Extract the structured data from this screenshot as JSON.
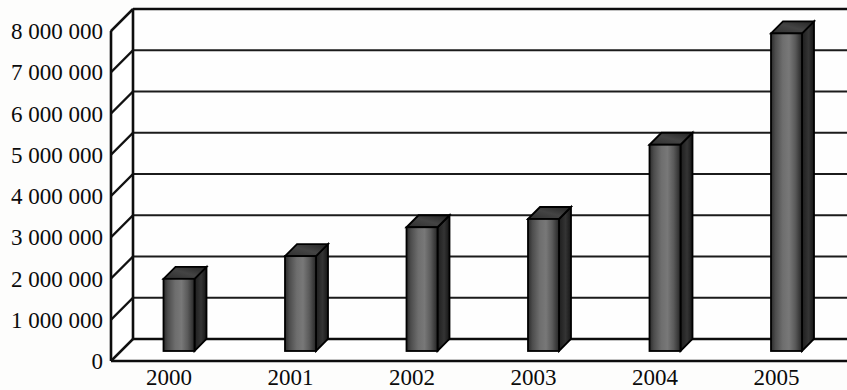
{
  "chart_data": {
    "type": "bar",
    "title": "",
    "subtitle": "",
    "xlabel": "",
    "ylabel": "",
    "categories": [
      "2000",
      "2001",
      "2002",
      "2003",
      "2004",
      "2005"
    ],
    "values": [
      1750000,
      2300000,
      3000000,
      3200000,
      5000000,
      7700000
    ],
    "series": [
      {
        "name": "",
        "values": [
          1750000,
          2300000,
          3000000,
          3200000,
          5000000,
          7700000
        ]
      }
    ],
    "ylim": [
      0,
      8000000
    ],
    "ytick_values": [
      0,
      1000000,
      2000000,
      3000000,
      4000000,
      5000000,
      6000000,
      7000000,
      8000000
    ],
    "ytick_labels": [
      "0",
      "1 000 000",
      "2 000 000",
      "3 000 000",
      "4 000 000",
      "5 000 000",
      "6 000 000",
      "7 000 000",
      "8 000 000"
    ],
    "grid": true,
    "grid_axis": "y",
    "legend": false,
    "legend_position": "none",
    "style": "3d-column",
    "bar_color": "#5f5f5f",
    "bar_edge_color": "#000000",
    "bar_top_color": "#3a3a3a",
    "bar_side_color": "#2b2b2b",
    "axis_color": "#0d0d0d",
    "grid_color": "#1b1b1b",
    "background_color": "#fdfdfc",
    "annotations": []
  }
}
